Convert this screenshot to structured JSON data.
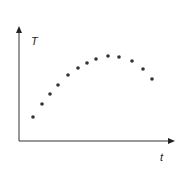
{
  "chart_data": {
    "type": "scatter",
    "title": "",
    "xlabel": "t",
    "ylabel": "T",
    "grid": false,
    "legend": null,
    "xticks": [],
    "yticks": [],
    "points_px": [
      [
        33,
        117
      ],
      [
        42,
        104
      ],
      [
        50,
        94
      ],
      [
        58,
        85
      ],
      [
        68,
        75
      ],
      [
        78,
        68
      ],
      [
        87,
        63
      ],
      [
        96,
        59
      ],
      [
        108,
        56
      ],
      [
        119,
        57
      ],
      [
        132,
        61
      ],
      [
        143,
        69
      ],
      [
        152,
        79
      ]
    ],
    "x": [
      1,
      2,
      3,
      4,
      5,
      6,
      7,
      8,
      9,
      10,
      11,
      12,
      13
    ],
    "y": [
      24,
      37,
      47,
      56,
      66,
      73,
      78,
      82,
      85,
      84,
      80,
      72,
      62
    ],
    "colors": {
      "axis": "#333333",
      "point": "#333333"
    }
  },
  "labels": {
    "y_axis": "T",
    "x_axis": "t"
  }
}
